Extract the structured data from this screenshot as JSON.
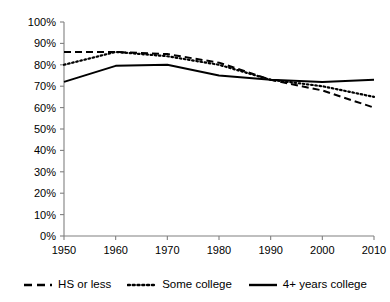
{
  "chart_data": {
    "type": "line",
    "title": "",
    "subtitle": "",
    "xlabel": "",
    "ylabel": "",
    "x": [
      1950,
      1960,
      1970,
      1980,
      1990,
      2000,
      2010
    ],
    "xlim": [
      1950,
      2010
    ],
    "ylim": [
      0,
      100
    ],
    "grid": false,
    "legend_position": "bottom",
    "x_tick_labels": [
      "1950",
      "1960",
      "1970",
      "1980",
      "1990",
      "2000",
      "2010"
    ],
    "y_tick_labels": [
      "0%",
      "10%",
      "20%",
      "30%",
      "40%",
      "50%",
      "60%",
      "70%",
      "80%",
      "90%",
      "100%"
    ],
    "y_tick_values": [
      0,
      10,
      20,
      30,
      40,
      50,
      60,
      70,
      80,
      90,
      100
    ],
    "series": [
      {
        "name": "HS or less",
        "style": "dashed",
        "color": "#000000",
        "values": [
          86,
          86,
          85,
          81,
          73,
          68,
          60
        ]
      },
      {
        "name": "Some college",
        "style": "dotted",
        "color": "#000000",
        "values": [
          80,
          86,
          84,
          80,
          73,
          70,
          65
        ]
      },
      {
        "name": "4+ years college",
        "style": "solid",
        "color": "#000000",
        "values": [
          72,
          79.5,
          80,
          75,
          73,
          72,
          73
        ]
      }
    ]
  },
  "legend": {
    "items": [
      {
        "label": "HS or less",
        "style": "dashed"
      },
      {
        "label": "Some college",
        "style": "dotted"
      },
      {
        "label": "4+ years college",
        "style": "solid"
      }
    ]
  }
}
